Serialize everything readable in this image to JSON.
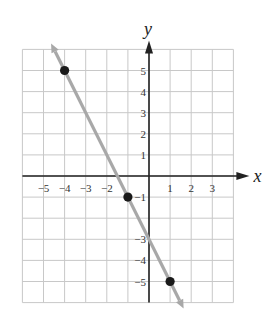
{
  "chart_data": {
    "type": "line",
    "title": "",
    "xlabel": "x",
    "ylabel": "y",
    "xlim": [
      -6,
      4
    ],
    "ylim": [
      -6,
      6
    ],
    "grid": true,
    "x_ticks": [
      -5,
      -4,
      -3,
      -2,
      1,
      2,
      3
    ],
    "x_tick_labels": [
      "−5",
      "−4",
      "−3",
      "−2",
      "1",
      "2",
      "3"
    ],
    "y_ticks": [
      5,
      4,
      3,
      2,
      1,
      -1,
      -3,
      -4,
      -5
    ],
    "y_tick_labels": [
      "5",
      "4",
      "3",
      "2",
      "1",
      "−1",
      "−3",
      "−4",
      "−5"
    ],
    "series": [
      {
        "name": "line",
        "equation": "y = -2x - 3",
        "color": "#a8a8a8",
        "points": [
          {
            "x": -4,
            "y": 5
          },
          {
            "x": -1,
            "y": -1
          },
          {
            "x": 1,
            "y": -5
          }
        ],
        "arrows_both_ends": true
      }
    ],
    "point_color": "#1a1a1a",
    "axis_color": "#222222",
    "grid_color": "#c8c8c8"
  }
}
